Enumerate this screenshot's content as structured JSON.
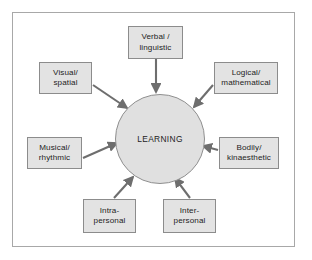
{
  "diagram": {
    "title": "LEARNING",
    "center": {
      "label": "LEARNING",
      "shape": "circle",
      "fill": "#e0e0e0",
      "stroke": "#8f8f8f"
    },
    "frame": {
      "stroke": "#a8a8a8",
      "fill": "#ffffff"
    },
    "style": {
      "box_fill": "#e3e3e3",
      "box_stroke": "#8c8c8c",
      "arrow_color": "#6e6e6e",
      "text_color": "#1d1d1d"
    },
    "nodes": [
      {
        "id": "verbal-linguistic",
        "line1": "Verbal /",
        "line2": "linguistic",
        "position": "top",
        "arrow_direction": "down"
      },
      {
        "id": "visual-spatial",
        "line1": "Visual/",
        "line2": "spatial",
        "position": "upper-left",
        "arrow_direction": "down-right"
      },
      {
        "id": "logical-mathematical",
        "line1": "Logical/",
        "line2": "mathematical",
        "position": "upper-right",
        "arrow_direction": "down-left"
      },
      {
        "id": "musical-rhythmic",
        "line1": "Musical/",
        "line2": "rhythmic",
        "position": "left",
        "arrow_direction": "up-right"
      },
      {
        "id": "bodily-kinaesthetic",
        "line1": "Bodily/",
        "line2": "kinaesthetic",
        "position": "right",
        "arrow_direction": "left"
      },
      {
        "id": "intra-personal",
        "line1": "Intra-",
        "line2": "personal",
        "position": "bottom-left",
        "arrow_direction": "up-right"
      },
      {
        "id": "inter-personal",
        "line1": "Inter-",
        "line2": "personal",
        "position": "bottom-right",
        "arrow_direction": "up-left"
      }
    ]
  }
}
